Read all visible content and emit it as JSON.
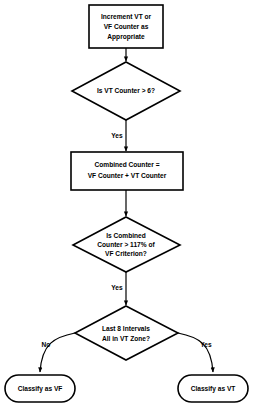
{
  "diagram": {
    "background_color": "#ffffff",
    "stroke_color": "#000000",
    "nodes": {
      "increment_counter": {
        "shape": "process",
        "line1": "Increment VT or",
        "line2": "VF Counter as",
        "line3": "Appropriate"
      },
      "vt_counter_check": {
        "shape": "decision",
        "line1": "Is VT Counter > 6?"
      },
      "combined_counter": {
        "shape": "process",
        "line1": "Combined Counter =",
        "line2": "VF Counter + VT Counter"
      },
      "combined_check": {
        "shape": "decision",
        "line1": "Is Combined",
        "line2": "Counter > 117% of",
        "line3": "VF Criterion?"
      },
      "intervals_check": {
        "shape": "decision",
        "line1": "Last 8 Intervals",
        "line2": "All in VT Zone?"
      },
      "classify_vf": {
        "shape": "terminal",
        "line1": "Classify as VF"
      },
      "classify_vt": {
        "shape": "terminal",
        "line1": "Classify as VT"
      }
    },
    "edge_labels": {
      "vt_counter_yes": "Yes",
      "combined_yes": "Yes",
      "intervals_no": "No",
      "intervals_yes": "Yes"
    }
  }
}
